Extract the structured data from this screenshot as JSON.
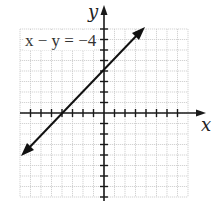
{
  "graph": {
    "x_axis_label": "x",
    "y_axis_label": "y",
    "equation_label": "x − y = −4",
    "grid": {
      "x_min": -8,
      "x_max": 8,
      "y_min": -8,
      "y_max": 8,
      "step": 1
    },
    "colors": {
      "grid": "#c8c8c8",
      "axis": "#1a1a1a",
      "line": "#111111"
    }
  },
  "chart_data": {
    "type": "line",
    "title": "x − y = −4",
    "xlabel": "x",
    "ylabel": "y",
    "xlim": [
      -8,
      8
    ],
    "ylim": [
      -8,
      8
    ],
    "grid": true,
    "series": [
      {
        "name": "x − y = −4",
        "equation": "y = x + 4",
        "x": [
          -8,
          -4,
          0,
          4
        ],
        "y": [
          -4,
          0,
          4,
          8
        ]
      }
    ],
    "intercepts": {
      "x_intercept": -4,
      "y_intercept": 4
    }
  }
}
